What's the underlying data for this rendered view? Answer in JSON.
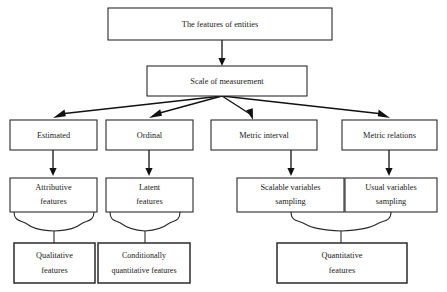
{
  "diagram": {
    "title": "The features of entities",
    "background_color": "#ffffff",
    "line_color": "#2b2b2b",
    "nodes": {
      "root": {
        "label": "The features of entities"
      },
      "scale": {
        "label": "Scale of measurement"
      },
      "estimated": {
        "label": "Estimated"
      },
      "ordinal": {
        "label": "Ordinal"
      },
      "metric_interval": {
        "label": "Metric interval"
      },
      "metric_relations": {
        "label": "Metric relations"
      },
      "attributive": {
        "line1": "Attributive",
        "line2": "features"
      },
      "latent": {
        "line1": "Latent",
        "line2": "features"
      },
      "scalable": {
        "line1": "Scalable variables",
        "line2": "sampling"
      },
      "usual": {
        "line1": "Usual variables",
        "line2": "sampling"
      },
      "qualitative": {
        "line1": "Qualitative",
        "line2": "features"
      },
      "conditionally": {
        "line1": "Conditionally",
        "line2": "quantitative features"
      },
      "quantitative": {
        "line1": "Quantitative",
        "line2": "features"
      }
    },
    "levels": [
      {
        "name": "level-1-root",
        "members": [
          "The features of entities"
        ]
      },
      {
        "name": "level-2-scale",
        "members": [
          "Scale of measurement"
        ]
      },
      {
        "name": "level-3-scales",
        "members": [
          "Estimated",
          "Ordinal",
          "Metric interval",
          "Metric relations"
        ]
      },
      {
        "name": "level-4-variables",
        "members": [
          "Attributive features",
          "Latent features",
          "Scalable variables sampling",
          "Usual variables sampling"
        ]
      },
      {
        "name": "level-5-outcomes",
        "members": [
          "Qualitative features",
          "Conditionally quantitative features",
          "Quantitative features"
        ]
      }
    ],
    "edges": [
      {
        "from": "The features of entities",
        "to": "Scale of measurement",
        "style": "arrow"
      },
      {
        "from": "Scale of measurement",
        "to": "Estimated",
        "style": "arrow"
      },
      {
        "from": "Scale of measurement",
        "to": "Ordinal",
        "style": "arrow"
      },
      {
        "from": "Scale of measurement",
        "to": "Metric interval",
        "style": "arrow"
      },
      {
        "from": "Scale of measurement",
        "to": "Metric relations",
        "style": "arrow"
      },
      {
        "from": "Estimated",
        "to": "Attributive features",
        "style": "arrow"
      },
      {
        "from": "Ordinal",
        "to": "Latent features",
        "style": "arrow"
      },
      {
        "from": "Metric interval",
        "to": "Scalable variables sampling",
        "style": "arrow"
      },
      {
        "from": "Metric relations",
        "to": "Usual variables sampling",
        "style": "arrow"
      },
      {
        "from": "Attributive features",
        "to": "Qualitative features",
        "style": "brace"
      },
      {
        "from": "Latent features",
        "to": "Conditionally quantitative features",
        "style": "brace"
      },
      {
        "from": "Scalable variables sampling",
        "to": "Quantitative features",
        "style": "brace"
      },
      {
        "from": "Usual variables sampling",
        "to": "Quantitative features",
        "style": "brace"
      }
    ]
  }
}
